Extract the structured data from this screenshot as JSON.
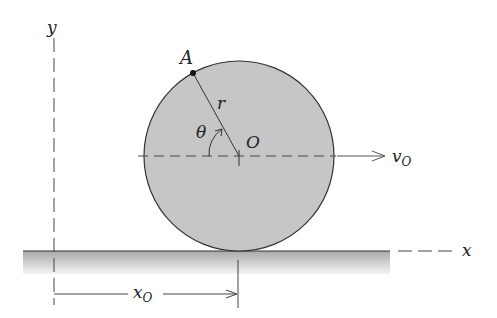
{
  "diagram": {
    "labels": {
      "point_A": "A",
      "radius": "r",
      "angle": "θ",
      "center": "O",
      "velocity": "v",
      "velocity_sub": "O",
      "x_axis": "x",
      "y_axis": "y",
      "displacement": "x",
      "displacement_sub": "O"
    },
    "colors": {
      "disk_fill": "#c8c8c8",
      "ground_fill_top": "#a8a8a8",
      "ground_fill_bottom": "#f2f2f2",
      "stroke": "#333333"
    }
  }
}
